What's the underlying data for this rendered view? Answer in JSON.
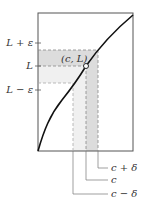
{
  "diagram": {
    "point_label": "(c, L)",
    "y_labels": {
      "upper": "L + ε",
      "middle": "L",
      "lower": "L − ε"
    },
    "x_labels": {
      "right": "c + δ",
      "center": "c",
      "left": "c − δ"
    },
    "colors": {
      "curve": "#111111",
      "frame": "#555555",
      "shade_dark": "#dcdcdc",
      "shade_light": "#efefef",
      "dash": "#888888",
      "text": "#333333"
    }
  }
}
